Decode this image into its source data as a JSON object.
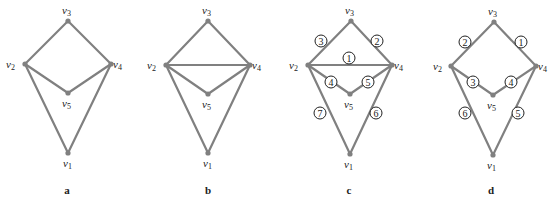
{
  "figure": {
    "colors": {
      "edge": "#808080",
      "node": "#808080",
      "text": "#222222"
    },
    "panels": [
      {
        "id": "a",
        "label": "a",
        "label_pos": [
          67,
          194
        ],
        "nodes": [
          {
            "id": "v1",
            "name": "v",
            "sub": "1",
            "x": 68,
            "y": 153,
            "lx": 63,
            "ly": 167
          },
          {
            "id": "v2",
            "name": "v",
            "sub": "2",
            "x": 25,
            "y": 64,
            "lx": 6,
            "ly": 68
          },
          {
            "id": "v3",
            "name": "v",
            "sub": "3",
            "x": 68,
            "y": 21,
            "lx": 62,
            "ly": 14
          },
          {
            "id": "v4",
            "name": "v",
            "sub": "4",
            "x": 111,
            "y": 64,
            "lx": 113,
            "ly": 68
          },
          {
            "id": "v5",
            "name": "v",
            "sub": "5",
            "x": 68,
            "y": 93,
            "lx": 62,
            "ly": 107
          }
        ],
        "edges": [
          {
            "from": "v2",
            "to": "v3"
          },
          {
            "from": "v3",
            "to": "v4"
          },
          {
            "from": "v2",
            "to": "v5"
          },
          {
            "from": "v5",
            "to": "v4"
          },
          {
            "from": "v2",
            "to": "v1"
          },
          {
            "from": "v4",
            "to": "v1"
          }
        ],
        "edge_labels": []
      },
      {
        "id": "b",
        "label": "b",
        "label_pos": [
          208,
          194
        ],
        "nodes": [
          {
            "id": "v1",
            "name": "v",
            "sub": "1",
            "x": 208,
            "y": 153,
            "lx": 203,
            "ly": 167
          },
          {
            "id": "v2",
            "name": "v",
            "sub": "2",
            "x": 166,
            "y": 65,
            "lx": 147,
            "ly": 69
          },
          {
            "id": "v3",
            "name": "v",
            "sub": "3",
            "x": 208,
            "y": 21,
            "lx": 202,
            "ly": 14
          },
          {
            "id": "v4",
            "name": "v",
            "sub": "4",
            "x": 250,
            "y": 65,
            "lx": 252,
            "ly": 69
          },
          {
            "id": "v5",
            "name": "v",
            "sub": "5",
            "x": 208,
            "y": 94,
            "lx": 202,
            "ly": 108
          }
        ],
        "edges": [
          {
            "from": "v2",
            "to": "v3"
          },
          {
            "from": "v3",
            "to": "v4"
          },
          {
            "from": "v2",
            "to": "v4"
          },
          {
            "from": "v2",
            "to": "v5"
          },
          {
            "from": "v5",
            "to": "v4"
          },
          {
            "from": "v2",
            "to": "v1"
          },
          {
            "from": "v4",
            "to": "v1"
          }
        ],
        "edge_labels": []
      },
      {
        "id": "c",
        "label": "c",
        "label_pos": [
          349,
          194
        ],
        "nodes": [
          {
            "id": "v1",
            "name": "v",
            "sub": "1",
            "x": 350,
            "y": 154,
            "lx": 344,
            "ly": 168
          },
          {
            "id": "v2",
            "name": "v",
            "sub": "2",
            "x": 308,
            "y": 65,
            "lx": 289,
            "ly": 69
          },
          {
            "id": "v3",
            "name": "v",
            "sub": "3",
            "x": 351,
            "y": 21,
            "lx": 345,
            "ly": 14
          },
          {
            "id": "v4",
            "name": "v",
            "sub": "4",
            "x": 392,
            "y": 65,
            "lx": 394,
            "ly": 69
          },
          {
            "id": "v5",
            "name": "v",
            "sub": "5",
            "x": 350,
            "y": 94,
            "lx": 344,
            "ly": 108
          }
        ],
        "edges": [
          {
            "from": "v2",
            "to": "v3"
          },
          {
            "from": "v3",
            "to": "v4"
          },
          {
            "from": "v2",
            "to": "v4"
          },
          {
            "from": "v2",
            "to": "v5"
          },
          {
            "from": "v5",
            "to": "v4"
          },
          {
            "from": "v2",
            "to": "v1"
          },
          {
            "from": "v4",
            "to": "v1"
          }
        ],
        "edge_labels": [
          {
            "text": "1",
            "x": 349,
            "y": 58
          },
          {
            "text": "2",
            "x": 377,
            "y": 41
          },
          {
            "text": "3",
            "x": 321,
            "y": 41
          },
          {
            "text": "4",
            "x": 331,
            "y": 82
          },
          {
            "text": "5",
            "x": 368,
            "y": 82
          },
          {
            "text": "6",
            "x": 376,
            "y": 113
          },
          {
            "text": "7",
            "x": 320,
            "y": 113
          }
        ]
      },
      {
        "id": "d",
        "label": "d",
        "label_pos": [
          491,
          194
        ],
        "nodes": [
          {
            "id": "v1",
            "name": "v",
            "sub": "1",
            "x": 493,
            "y": 155,
            "lx": 487,
            "ly": 169
          },
          {
            "id": "v2",
            "name": "v",
            "sub": "2",
            "x": 451,
            "y": 66,
            "lx": 433,
            "ly": 70
          },
          {
            "id": "v3",
            "name": "v",
            "sub": "3",
            "x": 494,
            "y": 22,
            "lx": 488,
            "ly": 15
          },
          {
            "id": "v4",
            "name": "v",
            "sub": "4",
            "x": 536,
            "y": 66,
            "lx": 538,
            "ly": 70
          },
          {
            "id": "v5",
            "name": "v",
            "sub": "5",
            "x": 493,
            "y": 95,
            "lx": 487,
            "ly": 109
          }
        ],
        "edges": [
          {
            "from": "v2",
            "to": "v3"
          },
          {
            "from": "v3",
            "to": "v4"
          },
          {
            "from": "v2",
            "to": "v5"
          },
          {
            "from": "v5",
            "to": "v4"
          },
          {
            "from": "v2",
            "to": "v1"
          },
          {
            "from": "v4",
            "to": "v1"
          }
        ],
        "edge_labels": [
          {
            "text": "1",
            "x": 521,
            "y": 42
          },
          {
            "text": "2",
            "x": 465,
            "y": 42
          },
          {
            "text": "3",
            "x": 473,
            "y": 82
          },
          {
            "text": "4",
            "x": 511,
            "y": 82
          },
          {
            "text": "5",
            "x": 518,
            "y": 113
          },
          {
            "text": "6",
            "x": 465,
            "y": 113
          }
        ]
      }
    ]
  }
}
